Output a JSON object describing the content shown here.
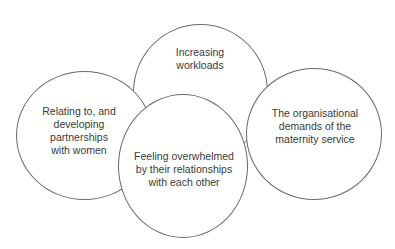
{
  "diagram": {
    "type": "overlapping-circles",
    "nodes": [
      {
        "id": "top",
        "lines": [
          "Increasing",
          "workloads"
        ]
      },
      {
        "id": "left",
        "lines": [
          "Relating to, and",
          "developing",
          "partnerships",
          "with women"
        ]
      },
      {
        "id": "right",
        "lines": [
          "The organisational",
          "demands of the",
          "maternity service"
        ]
      },
      {
        "id": "bottom",
        "lines": [
          "Feeling overwhelmed",
          "by their relationships",
          "with each other"
        ]
      }
    ],
    "stroke_color": "#6a6a6a",
    "text_color": "#3a3a3a",
    "background": "#ffffff"
  }
}
